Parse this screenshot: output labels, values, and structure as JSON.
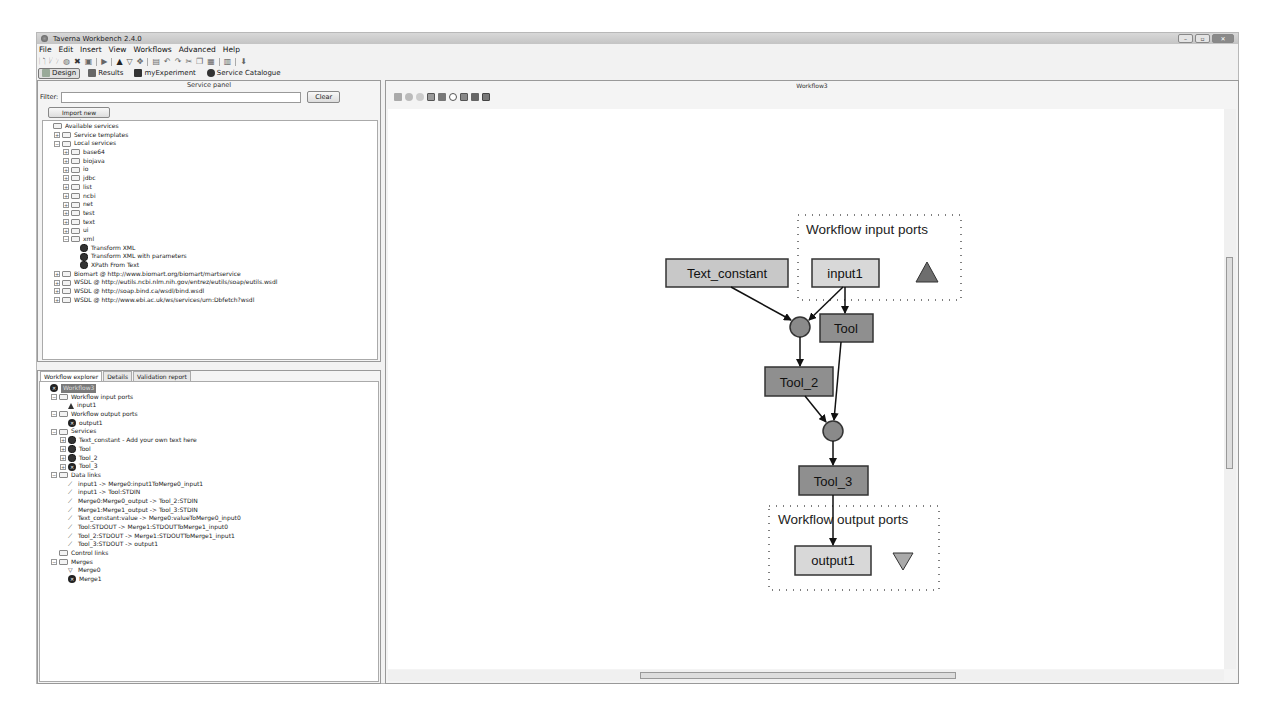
{
  "window": {
    "title": "Taverna Workbench 2.4.0",
    "controls": [
      "minimize",
      "maximize",
      "close"
    ]
  },
  "menubar": [
    "File",
    "Edit",
    "Insert",
    "View",
    "Workflows",
    "Advanced",
    "Help"
  ],
  "perspectives": [
    {
      "label": "Design",
      "icon": "design-icon",
      "active": true
    },
    {
      "label": "Results",
      "icon": "results-icon",
      "active": false
    },
    {
      "label": "myExperiment",
      "icon": "myexperiment-icon",
      "active": false
    },
    {
      "label": "Service Catalogue",
      "icon": "gear-icon",
      "active": false
    }
  ],
  "service_panel": {
    "title": "Service panel",
    "filter_label": "Filter:",
    "filter_value": "",
    "clear_label": "Clear",
    "import_label": "Import new services",
    "tree": [
      {
        "label": "Available services",
        "level": 0,
        "type": "folder",
        "expander": ""
      },
      {
        "label": "Service templates",
        "level": 1,
        "type": "folder",
        "expander": "+"
      },
      {
        "label": "Local services",
        "level": 1,
        "type": "folder",
        "expander": "-"
      },
      {
        "label": "base64",
        "level": 2,
        "type": "folder",
        "expander": "+"
      },
      {
        "label": "biojava",
        "level": 2,
        "type": "folder",
        "expander": "+"
      },
      {
        "label": "io",
        "level": 2,
        "type": "folder",
        "expander": "+"
      },
      {
        "label": "jdbc",
        "level": 2,
        "type": "folder",
        "expander": "+"
      },
      {
        "label": "list",
        "level": 2,
        "type": "folder",
        "expander": "+"
      },
      {
        "label": "ncbi",
        "level": 2,
        "type": "folder",
        "expander": "+"
      },
      {
        "label": "net",
        "level": 2,
        "type": "folder",
        "expander": "+"
      },
      {
        "label": "test",
        "level": 2,
        "type": "folder",
        "expander": "+"
      },
      {
        "label": "text",
        "level": 2,
        "type": "folder",
        "expander": "+"
      },
      {
        "label": "ui",
        "level": 2,
        "type": "folder",
        "expander": "+"
      },
      {
        "label": "xml",
        "level": 2,
        "type": "folder",
        "expander": "-"
      },
      {
        "label": "Transform XML",
        "level": 3,
        "type": "gear",
        "expander": ""
      },
      {
        "label": "Transform XML with parameters",
        "level": 3,
        "type": "gear",
        "expander": ""
      },
      {
        "label": "XPath From Text",
        "level": 3,
        "type": "gear",
        "expander": ""
      },
      {
        "label": "Biomart @ http://www.biomart.org/biomart/martservice",
        "level": 1,
        "type": "folder",
        "expander": "+"
      },
      {
        "label": "WSDL @ http://eutils.ncbi.nlm.nih.gov/entrez/eutils/soap/eutils.wsdl",
        "level": 1,
        "type": "folder",
        "expander": "+"
      },
      {
        "label": "WSDL @ http://soap.bind.ca/wsdl/bind.wsdl",
        "level": 1,
        "type": "folder",
        "expander": "+"
      },
      {
        "label": "WSDL @ http://www.ebi.ac.uk/ws/services/urn:Dbfetch?wsdl",
        "level": 1,
        "type": "folder",
        "expander": "+"
      }
    ]
  },
  "explorer": {
    "tabs": [
      {
        "label": "Workflow explorer",
        "active": true
      },
      {
        "label": "Details",
        "active": false
      },
      {
        "label": "Validation report",
        "active": false
      }
    ],
    "tree": [
      {
        "label": "Workflow3",
        "level": 0,
        "type": "root",
        "expander": ""
      },
      {
        "label": "Workflow input ports",
        "level": 1,
        "type": "folder",
        "expander": "-"
      },
      {
        "label": "input1",
        "level": 2,
        "type": "triangle",
        "expander": ""
      },
      {
        "label": "Workflow output ports",
        "level": 1,
        "type": "folder",
        "expander": "-"
      },
      {
        "label": "output1",
        "level": 2,
        "type": "x",
        "expander": ""
      },
      {
        "label": "Services",
        "level": 1,
        "type": "folder",
        "expander": "-"
      },
      {
        "label": "Text_constant - Add your own text here",
        "level": 2,
        "type": "gear",
        "expander": "+"
      },
      {
        "label": "Tool",
        "level": 2,
        "type": "gear",
        "expander": "+"
      },
      {
        "label": "Tool_2",
        "level": 2,
        "type": "gear",
        "expander": "+"
      },
      {
        "label": "Tool_3",
        "level": 2,
        "type": "x",
        "expander": "+"
      },
      {
        "label": "Data links",
        "level": 1,
        "type": "folder",
        "expander": "-"
      },
      {
        "label": "input1 -> Merge0:input1ToMerge0_input1",
        "level": 2,
        "type": "link",
        "expander": ""
      },
      {
        "label": "input1 -> Tool:STDIN",
        "level": 2,
        "type": "link",
        "expander": ""
      },
      {
        "label": "Merge0:Merge0_output -> Tool_2:STDIN",
        "level": 2,
        "type": "link",
        "expander": ""
      },
      {
        "label": "Merge1:Merge1_output -> Tool_3:STDIN",
        "level": 2,
        "type": "link",
        "expander": ""
      },
      {
        "label": "Text_constant:value -> Merge0:valueToMerge0_input0",
        "level": 2,
        "type": "link",
        "expander": ""
      },
      {
        "label": "Tool:STDOUT -> Merge1:STDOUTToMerge1_input0",
        "level": 2,
        "type": "link",
        "expander": ""
      },
      {
        "label": "Tool_2:STDOUT -> Merge1:STDOUTToMerge1_input1",
        "level": 2,
        "type": "link",
        "expander": ""
      },
      {
        "label": "Tool_3:STDOUT -> output1",
        "level": 2,
        "type": "link",
        "expander": ""
      },
      {
        "label": "Control links",
        "level": 1,
        "type": "folder",
        "expander": ""
      },
      {
        "label": "Merges",
        "level": 1,
        "type": "folder",
        "expander": "-"
      },
      {
        "label": "Merge0",
        "level": 2,
        "type": "merge",
        "expander": ""
      },
      {
        "label": "Merge1",
        "level": 2,
        "type": "x",
        "expander": ""
      }
    ]
  },
  "diagram": {
    "title": "Workflow3",
    "toolbar": [
      "save-diagram-icon",
      "zoom-in-icon",
      "zoom-out-icon",
      "layout-no-ports-icon",
      "layout-all-ports-icon",
      "blobs-icon",
      "vertical-align-icon",
      "horizontal-align-icon",
      "expand-nested-icon"
    ],
    "input_group_label": "Workflow input ports",
    "output_group_label": "Workflow output ports",
    "nodes": {
      "text_constant": "Text_constant",
      "input1": "input1",
      "tool": "Tool",
      "tool_2": "Tool_2",
      "tool_3": "Tool_3",
      "output1": "output1"
    },
    "colors": {
      "constant_fill": "#c8c8c8",
      "port_fill": "#d8d8d8",
      "tool_fill": "#8f8f8f",
      "merge_fill": "#8a8a8a",
      "input_triangle": "#6e6e6e",
      "output_triangle": "#aaaaaa"
    }
  }
}
